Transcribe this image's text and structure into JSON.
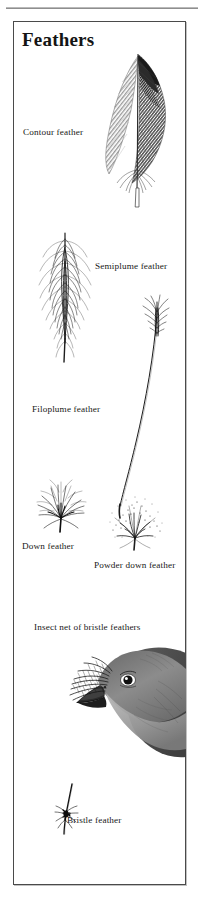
{
  "plate": {
    "title": "Feathers",
    "labels": {
      "contour": "Contour feather",
      "semiplume": "Semiplume feather",
      "filoplume": "Filoplume feather",
      "down": "Down feather",
      "powder_down": "Powder down feather",
      "insect_net": "Insect net of bristle feathers",
      "bristle": "Bristle feather"
    },
    "figures": [
      {
        "name": "contour-feather",
        "label": "Contour feather"
      },
      {
        "name": "semiplume-feather",
        "label": "Semiplume feather"
      },
      {
        "name": "filoplume-feather",
        "label": "Filoplume feather"
      },
      {
        "name": "down-feather",
        "label": "Down feather"
      },
      {
        "name": "powder-down-feather",
        "label": "Powder down feather"
      },
      {
        "name": "bird-head-bristles",
        "label": "Insect net of bristle feathers"
      },
      {
        "name": "bristle-feather",
        "label": "Bristle feather"
      }
    ],
    "colors": {
      "ink": "#181818",
      "frame": "#4a4a4a",
      "rule": "#8e8e8e",
      "paper": "#ffffff",
      "plumage_mid": "#8a8a8a",
      "plumage_dark": "#3b3b3b"
    }
  }
}
